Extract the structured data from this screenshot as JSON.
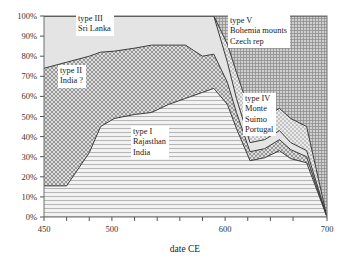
{
  "chart_data": {
    "type": "area",
    "title": "",
    "subtitle": "",
    "xlabel": "date CE",
    "ylabel": "",
    "xlim": [
      450,
      700
    ],
    "ylim": [
      0,
      100
    ],
    "grid": false,
    "stacked": true,
    "legend_position": "in-plot annotations",
    "xticks": [
      450,
      470,
      490,
      510,
      530,
      550,
      570,
      590,
      610,
      630,
      650,
      670,
      700
    ],
    "xtick_labels": [
      "450",
      "",
      "",
      "500",
      "",
      "",
      "",
      "",
      "600",
      "",
      "",
      "",
      "700"
    ],
    "yticks": [
      0,
      10,
      20,
      30,
      40,
      50,
      60,
      70,
      80,
      90,
      100
    ],
    "ytick_labels": [
      "0%",
      "10%",
      "20%",
      "30%",
      "40%",
      "50%",
      "60%",
      "70%",
      "80%",
      "90%",
      "100%"
    ],
    "x": [
      450,
      470,
      490,
      500,
      512,
      530,
      545,
      560,
      575,
      590,
      600,
      612,
      620,
      632,
      645,
      658,
      668,
      682,
      700
    ],
    "series": [
      {
        "name": "type I",
        "label_lines": [
          "type I",
          "Rajasthan",
          "India"
        ],
        "cumulative_top": [
          15.5,
          15.5,
          32,
          45,
          49,
          51,
          52,
          56,
          59,
          62,
          64,
          56,
          44,
          28,
          29.5,
          33,
          29,
          27,
          0
        ],
        "fill": "horizontal-lines"
      },
      {
        "name": "type II",
        "label_lines": [
          "type II",
          "India ?"
        ],
        "cumulative_top": [
          74,
          77,
          80,
          82,
          82.5,
          84,
          85.5,
          85.5,
          85.5,
          80,
          81,
          67,
          52,
          32.5,
          34,
          38.5,
          33.5,
          30,
          0
        ],
        "fill": "cross-hatch-fine"
      },
      {
        "name": "type III",
        "label_lines": [
          "type III",
          "Sri Lanka"
        ],
        "cumulative_top": [
          100,
          100,
          100,
          100,
          100,
          100,
          100,
          100,
          100,
          100,
          100,
          77,
          59,
          37,
          38.5,
          43,
          37,
          33,
          0
        ],
        "fill": "light-grey"
      },
      {
        "name": "type IV",
        "label_lines": [
          "type IV",
          "Monte",
          "Suimo",
          "Portugal"
        ],
        "cumulative_top": [
          100,
          100,
          100,
          100,
          100,
          100,
          100,
          100,
          100,
          100,
          100,
          86,
          72,
          52,
          50,
          54,
          49,
          45,
          0
        ],
        "fill": "stipple"
      },
      {
        "name": "type V",
        "label_lines": [
          "type V",
          "Bohemia mounts",
          "Czech rep"
        ],
        "cumulative_top": [
          100,
          100,
          100,
          100,
          100,
          100,
          100,
          100,
          100,
          100,
          100,
          100,
          100,
          100,
          100,
          100,
          100,
          100,
          100
        ],
        "fill": "dense-grid-hatch"
      }
    ],
    "annotations": [
      {
        "id": "type-iii",
        "lines": [
          "type III",
          "Sri Lanka"
        ]
      },
      {
        "id": "type-ii",
        "lines": [
          "type II",
          "India ?"
        ]
      },
      {
        "id": "type-i",
        "lines": [
          "type I",
          "Rajasthan",
          "India"
        ]
      },
      {
        "id": "type-v",
        "lines": [
          "type V",
          "Bohemia mounts",
          "Czech rep"
        ]
      },
      {
        "id": "type-iv",
        "lines": [
          "type IV",
          "Monte",
          "Suimo",
          "Portugal"
        ]
      }
    ],
    "colors": {
      "axis": "#555555",
      "outline": "#3a3a3a",
      "type_i": "#d9d9d9",
      "type_ii": "#b9b9b9",
      "type_iii": "#e2e2e2",
      "type_iv": "#cfcfcf",
      "type_v": "#a8a8a8"
    }
  }
}
